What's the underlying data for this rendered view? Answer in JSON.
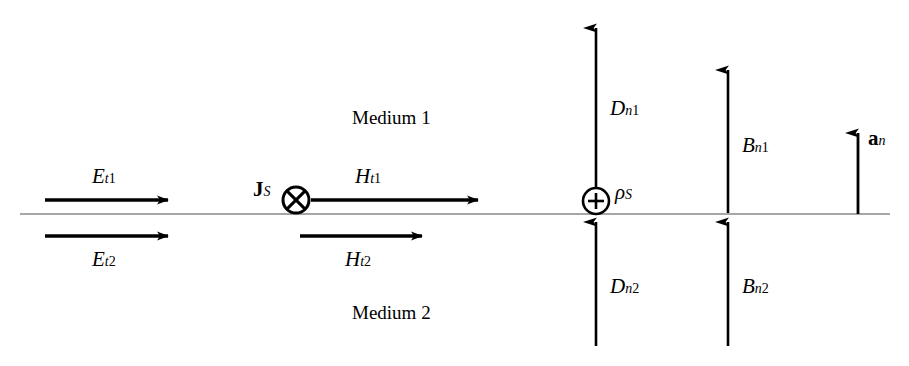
{
  "figure": {
    "background_color": "#ffffff",
    "stroke_color": "#000000",
    "interface_line_color": "#808080",
    "width": 909,
    "height": 366
  },
  "regions": {
    "medium_1_label": "Medium 1",
    "medium_2_label": "Medium 2"
  },
  "interface": {
    "name": "boundary-interface-line",
    "y": 214,
    "x_start": 20,
    "x_end": 890
  },
  "tangential_fields": [
    {
      "id": "E_t1",
      "base": "E",
      "sub_italic": "t",
      "sub_roman": "1",
      "label": "E_t1",
      "side": "medium-1",
      "direction": "right",
      "x1": 45,
      "y1": 200,
      "x2": 168,
      "y2": 200,
      "label_x": 92,
      "label_y": 166
    },
    {
      "id": "E_t2",
      "base": "E",
      "sub_italic": "t",
      "sub_roman": "2",
      "label": "E_t2",
      "side": "medium-2",
      "direction": "right",
      "x1": 45,
      "y1": 236,
      "x2": 168,
      "y2": 236,
      "label_x": 92,
      "label_y": 249
    },
    {
      "id": "H_t1",
      "base": "H",
      "sub_italic": "t",
      "sub_roman": "1",
      "label": "H_t1",
      "side": "medium-1",
      "direction": "right",
      "x1": 311,
      "y1": 200,
      "x2": 478,
      "y2": 200,
      "label_x": 355,
      "label_y": 166
    },
    {
      "id": "H_t2",
      "base": "H",
      "sub_italic": "t",
      "sub_roman": "2",
      "label": "H_t2",
      "side": "medium-2",
      "direction": "right",
      "x1": 300,
      "y1": 236,
      "x2": 422,
      "y2": 236,
      "label_x": 345,
      "label_y": 249
    }
  ],
  "normal_fields": [
    {
      "id": "D_n1",
      "base": "D",
      "sub_italic": "n",
      "sub_roman": "1",
      "label": "D_n1",
      "side": "medium-1",
      "direction": "up",
      "x": 596,
      "y_tail": 200,
      "y_tip": 28,
      "label_x": 610,
      "label_y": 98
    },
    {
      "id": "D_n2",
      "base": "D",
      "sub_italic": "n",
      "sub_roman": "2",
      "label": "D_n2",
      "side": "medium-2",
      "direction": "up",
      "x": 596,
      "y_tail": 346,
      "y_tip": 222,
      "label_x": 610,
      "label_y": 276
    },
    {
      "id": "B_n1",
      "base": "B",
      "sub_italic": "n",
      "sub_roman": "1",
      "label": "B_n1",
      "side": "medium-1",
      "direction": "up",
      "x": 728,
      "y_tail": 213,
      "y_tip": 70,
      "label_x": 742,
      "label_y": 135
    },
    {
      "id": "B_n2",
      "base": "B",
      "sub_italic": "n",
      "sub_roman": "2",
      "label": "B_n2",
      "side": "medium-2",
      "direction": "up",
      "x": 728,
      "y_tail": 346,
      "y_tip": 222,
      "label_x": 742,
      "label_y": 276
    }
  ],
  "unit_normal": {
    "id": "a_n",
    "base": "a",
    "sub_italic": "n",
    "label": "a_n",
    "bold": true,
    "direction": "up",
    "x": 858,
    "y_tail": 214,
    "y_tip": 133,
    "label_x": 868,
    "label_y": 128
  },
  "surface_sources": [
    {
      "id": "J_S",
      "base": "J",
      "sub_italic": "S",
      "label": "J_S",
      "bold": true,
      "glyph": "circle-cross",
      "meaning": "surface current into page",
      "cx": 296,
      "cy": 200,
      "r": 13,
      "label_x": 253,
      "label_y": 179
    },
    {
      "id": "rho_S",
      "base": "ρ",
      "sub_italic": "S",
      "label": "ρ_S",
      "bold": false,
      "glyph": "circle-plus",
      "meaning": "surface charge density",
      "cx": 596,
      "cy": 201,
      "r": 13,
      "label_x": 615,
      "label_y": 182
    }
  ]
}
